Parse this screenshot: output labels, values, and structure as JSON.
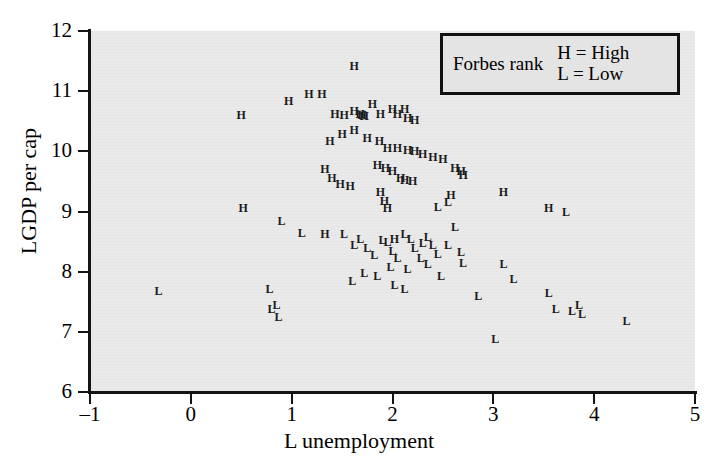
{
  "axes": {
    "x_title": "L unemployment",
    "y_title": "LGDP per cap",
    "x_ticks": [
      "-1",
      "0",
      "1",
      "2",
      "3",
      "4",
      "5"
    ],
    "y_ticks": [
      "12",
      "11",
      "10",
      "9",
      "8",
      "7",
      "6"
    ]
  },
  "legend": {
    "title": "Forbes rank",
    "entries": [
      "H = High",
      "L = Low"
    ]
  },
  "colors": {
    "plot_background": "#e9e9e9",
    "page_background": "#ffffff",
    "axis": "#141414",
    "marker": "#1a1a1a",
    "legend_border": "#111111"
  },
  "chart_data": {
    "type": "scatter",
    "title": "",
    "xlabel": "L unemployment",
    "ylabel": "LGDP per cap",
    "xlim": [
      -1,
      5
    ],
    "ylim": [
      6,
      12
    ],
    "xticks": [
      -1,
      0,
      1,
      2,
      3,
      4,
      5
    ],
    "yticks": [
      6,
      7,
      8,
      9,
      10,
      11,
      12
    ],
    "grid": false,
    "legend_position": "top-right",
    "marker_style": "text-label",
    "series": [
      {
        "name": "H = High",
        "label": "H",
        "points": [
          [
            0.5,
            10.6
          ],
          [
            0.97,
            10.83
          ],
          [
            1.17,
            10.95
          ],
          [
            1.3,
            10.95
          ],
          [
            1.62,
            11.42
          ],
          [
            1.43,
            10.62
          ],
          [
            1.52,
            10.6
          ],
          [
            1.62,
            10.67
          ],
          [
            1.68,
            10.62
          ],
          [
            1.7,
            10.6
          ],
          [
            1.72,
            10.58
          ],
          [
            1.8,
            10.78
          ],
          [
            1.88,
            10.62
          ],
          [
            2.0,
            10.7
          ],
          [
            2.05,
            10.62
          ],
          [
            2.12,
            10.7
          ],
          [
            2.15,
            10.55
          ],
          [
            2.22,
            10.52
          ],
          [
            1.38,
            10.18
          ],
          [
            1.5,
            10.28
          ],
          [
            1.62,
            10.35
          ],
          [
            1.75,
            10.22
          ],
          [
            1.87,
            10.18
          ],
          [
            1.95,
            10.05
          ],
          [
            2.05,
            10.05
          ],
          [
            2.15,
            10.02
          ],
          [
            2.22,
            10.0
          ],
          [
            1.33,
            9.7
          ],
          [
            1.4,
            9.55
          ],
          [
            1.48,
            9.45
          ],
          [
            1.58,
            9.42
          ],
          [
            1.85,
            9.78
          ],
          [
            1.93,
            9.72
          ],
          [
            2.0,
            9.68
          ],
          [
            2.08,
            9.55
          ],
          [
            2.12,
            9.52
          ],
          [
            2.2,
            9.5
          ],
          [
            1.88,
            9.32
          ],
          [
            1.92,
            9.18
          ],
          [
            1.95,
            9.05
          ],
          [
            2.3,
            9.95
          ],
          [
            2.4,
            9.9
          ],
          [
            2.5,
            9.88
          ],
          [
            2.62,
            9.72
          ],
          [
            2.68,
            9.68
          ],
          [
            2.7,
            9.6
          ],
          [
            2.58,
            9.28
          ],
          [
            3.1,
            9.32
          ],
          [
            3.55,
            9.05
          ],
          [
            0.52,
            9.05
          ],
          [
            1.33,
            8.62
          ],
          [
            2.02,
            8.55
          ]
        ]
      },
      {
        "name": "L = Low",
        "label": "L",
        "points": [
          [
            -0.32,
            7.68
          ],
          [
            0.78,
            7.72
          ],
          [
            0.85,
            7.45
          ],
          [
            0.8,
            7.38
          ],
          [
            0.87,
            7.25
          ],
          [
            0.9,
            8.85
          ],
          [
            1.1,
            8.65
          ],
          [
            1.52,
            8.62
          ],
          [
            1.62,
            8.45
          ],
          [
            1.68,
            8.55
          ],
          [
            1.75,
            8.4
          ],
          [
            1.82,
            8.28
          ],
          [
            1.9,
            8.52
          ],
          [
            1.95,
            8.5
          ],
          [
            2.0,
            8.35
          ],
          [
            2.05,
            8.22
          ],
          [
            2.12,
            8.62
          ],
          [
            2.18,
            8.55
          ],
          [
            2.22,
            8.4
          ],
          [
            2.3,
            8.48
          ],
          [
            2.35,
            8.58
          ],
          [
            2.4,
            8.45
          ],
          [
            2.45,
            8.3
          ],
          [
            2.28,
            8.22
          ],
          [
            2.35,
            8.12
          ],
          [
            2.15,
            8.05
          ],
          [
            1.98,
            8.08
          ],
          [
            1.85,
            7.92
          ],
          [
            1.72,
            7.98
          ],
          [
            1.6,
            7.85
          ],
          [
            2.02,
            7.78
          ],
          [
            2.12,
            7.72
          ],
          [
            2.45,
            9.08
          ],
          [
            2.55,
            9.15
          ],
          [
            2.62,
            8.75
          ],
          [
            2.55,
            8.45
          ],
          [
            2.68,
            8.32
          ],
          [
            2.7,
            8.15
          ],
          [
            2.48,
            7.92
          ],
          [
            3.02,
            6.88
          ],
          [
            3.1,
            8.12
          ],
          [
            3.2,
            7.88
          ],
          [
            3.55,
            7.65
          ],
          [
            3.72,
            9.0
          ],
          [
            3.62,
            7.38
          ],
          [
            3.78,
            7.35
          ],
          [
            3.85,
            7.45
          ],
          [
            3.88,
            7.3
          ],
          [
            4.32,
            7.18
          ],
          [
            2.85,
            7.6
          ]
        ]
      }
    ]
  }
}
